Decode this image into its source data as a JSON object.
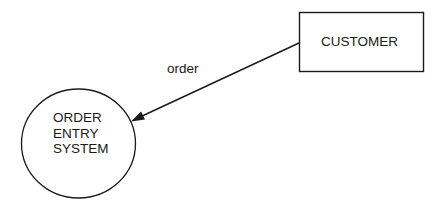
{
  "diagram": {
    "type": "data-flow-diagram",
    "external_entity": {
      "label": "CUSTOMER",
      "shape": "rectangle"
    },
    "process": {
      "lines": [
        "ORDER",
        "ENTRY",
        "SYSTEM"
      ],
      "shape": "circle"
    },
    "flows": [
      {
        "label": "order",
        "from": "CUSTOMER",
        "to": "ORDER ENTRY SYSTEM"
      }
    ],
    "colors": {
      "stroke": "#1a1a1a",
      "background": "#ffffff"
    }
  }
}
